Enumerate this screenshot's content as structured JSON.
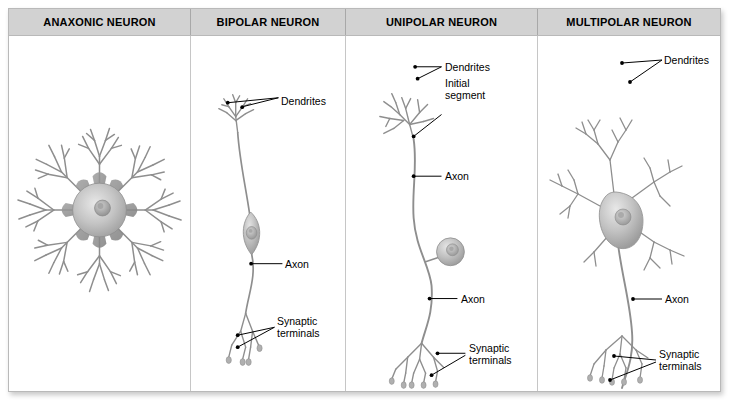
{
  "figure": {
    "type": "neuron-classification-diagram",
    "columns": [
      {
        "id": "anaxonic",
        "header": "ANAXONIC NEURON",
        "labels": []
      },
      {
        "id": "bipolar",
        "header": "BIPOLAR NEURON",
        "labels": [
          {
            "id": "dendrites",
            "text": "Dendrites"
          },
          {
            "id": "axon",
            "text": "Axon"
          },
          {
            "id": "synaptic-terminals-line1",
            "text": "Synaptic"
          },
          {
            "id": "synaptic-terminals-line2",
            "text": "terminals"
          }
        ]
      },
      {
        "id": "unipolar",
        "header": "UNIPOLAR NEURON",
        "labels": [
          {
            "id": "dendrites",
            "text": "Dendrites"
          },
          {
            "id": "initial-segment-line1",
            "text": "Initial"
          },
          {
            "id": "initial-segment-line2",
            "text": "segment"
          },
          {
            "id": "axon-upper",
            "text": "Axon"
          },
          {
            "id": "axon-lower",
            "text": "Axon"
          },
          {
            "id": "synaptic-terminals-line1",
            "text": "Synaptic"
          },
          {
            "id": "synaptic-terminals-line2",
            "text": "terminals"
          }
        ]
      },
      {
        "id": "multipolar",
        "header": "MULTIPOLAR NEURON",
        "labels": [
          {
            "id": "dendrites",
            "text": "Dendrites"
          },
          {
            "id": "axon",
            "text": "Axon"
          },
          {
            "id": "synaptic-terminals-line1",
            "text": "Synaptic"
          },
          {
            "id": "synaptic-terminals-line2",
            "text": "terminals"
          }
        ]
      }
    ],
    "colors": {
      "header_background": "#d2d2d2",
      "frame_border": "#b9b9b9",
      "divider": "#c6c6c6",
      "label_text": "#000000",
      "leader_line": "#000000",
      "neuron_outline": "#8a8a8a",
      "soma_fill": "#b5b5b5",
      "page_background": "#ffffff"
    }
  }
}
